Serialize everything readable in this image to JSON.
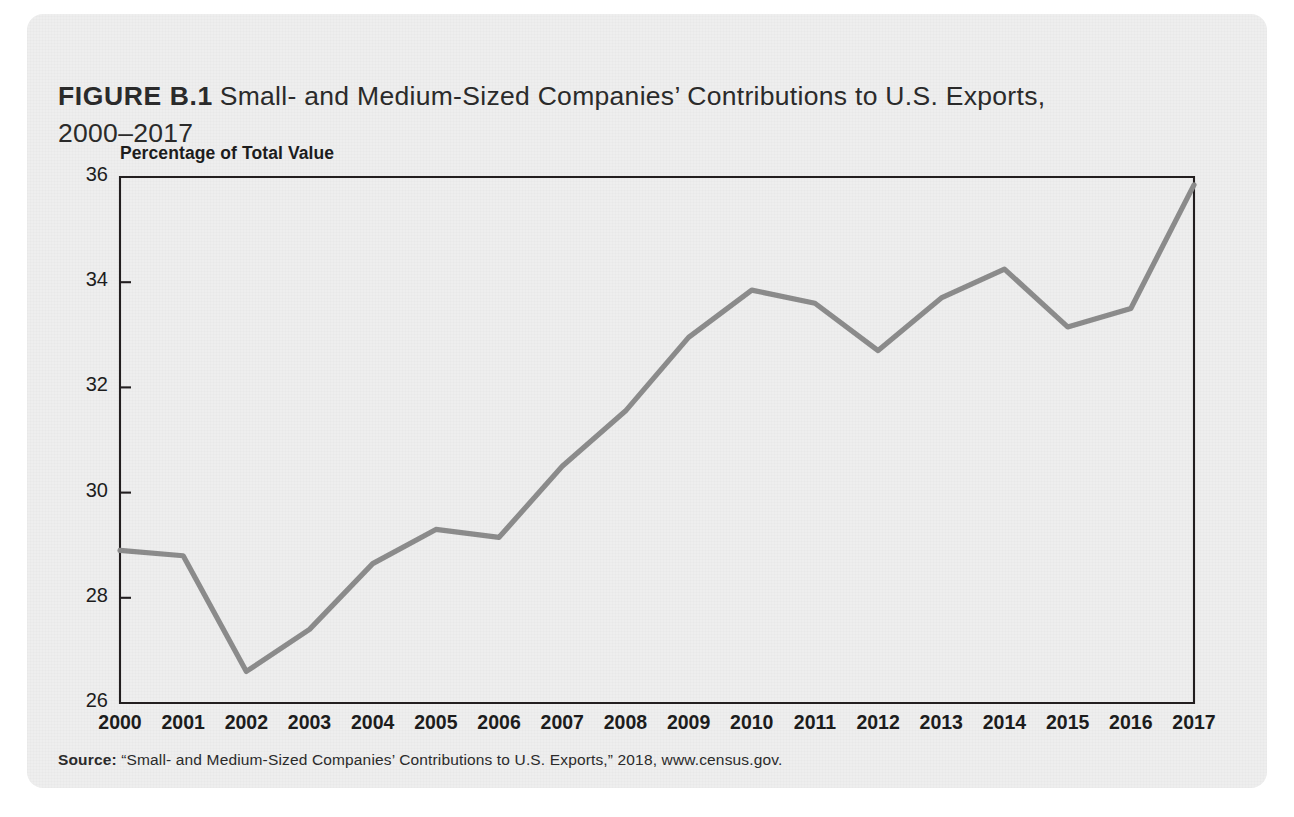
{
  "figure": {
    "label": "FIGURE B.1",
    "title": "Small- and Medium-Sized Companies’ Contributions to U.S. Exports,\n2000–2017",
    "source_label": "Source:",
    "source_text": "“Small- and Medium-Sized Companies’ Contributions to U.S. Exports,” 2018, www.census.gov.",
    "card_background": "#eeeeee",
    "line_color": "#8c8c8c",
    "axis_color": "#231f20",
    "text_color": "#1d1d1d"
  },
  "chart_data": {
    "type": "line",
    "title": "Small- and Medium-Sized Companies’ Contributions to U.S. Exports, 2000–2017",
    "xlabel": "",
    "ylabel": "Percentage of Total Value",
    "categories": [
      "2000",
      "2001",
      "2002",
      "2003",
      "2004",
      "2005",
      "2006",
      "2007",
      "2008",
      "2009",
      "2010",
      "2011",
      "2012",
      "2013",
      "2014",
      "2015",
      "2016",
      "2017"
    ],
    "values": [
      28.9,
      28.8,
      26.6,
      27.4,
      28.65,
      29.3,
      29.15,
      30.5,
      31.55,
      32.95,
      33.85,
      33.6,
      32.7,
      33.7,
      34.25,
      33.15,
      33.5,
      35.85
    ],
    "ylim": [
      26,
      36
    ],
    "yticks": [
      26,
      28,
      30,
      32,
      34,
      36
    ],
    "ytick_labels": [
      "26",
      "28",
      "30",
      "32",
      "34",
      "36"
    ],
    "grid": false,
    "legend": false,
    "series_name": "Percentage of Total Value"
  }
}
